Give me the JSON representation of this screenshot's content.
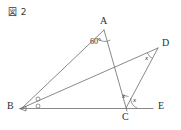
{
  "figure": {
    "caption": "図 2",
    "type": "euclidean-geometry-diagram",
    "stroke_color": "#6b6b6b",
    "label_color": "#2e2e2e",
    "background": "#ffffff",
    "vertices": [
      {
        "id": "A",
        "label": "A",
        "x": 104,
        "y": 30,
        "label_x": 100,
        "label_y": 17
      },
      {
        "id": "B",
        "label": "B",
        "x": 22,
        "y": 108,
        "label_x": 8,
        "label_y": 102
      },
      {
        "id": "C",
        "label": "C",
        "x": 126,
        "y": 108,
        "label_x": 122,
        "label_y": 112
      },
      {
        "id": "D",
        "label": "D",
        "x": 158,
        "y": 48,
        "label_x": 163,
        "label_y": 39
      },
      {
        "id": "E",
        "label": "E",
        "x": 152,
        "y": 108,
        "label_x": 158,
        "label_y": 101
      }
    ],
    "segments": [
      {
        "name": "segment-BA",
        "from": "B",
        "to": "A"
      },
      {
        "name": "segment-AC",
        "from": "A",
        "to": "C"
      },
      {
        "name": "segment-BD",
        "from": "B",
        "to": "D"
      },
      {
        "name": "segment-CD",
        "from": "C",
        "to": "D"
      },
      {
        "name": "segment-BE",
        "from": "B",
        "to": "E"
      }
    ],
    "angle_labels": [
      {
        "name": "angle-A-60",
        "text": "60°",
        "x": 91,
        "y": 38,
        "style": "plain"
      },
      {
        "name": "angle-D-x",
        "text": "x",
        "x": 146,
        "y": 56,
        "style": "var"
      },
      {
        "name": "angle-BCA-x",
        "text": "x",
        "x": 122,
        "y": 95,
        "style": "var"
      },
      {
        "name": "angle-DCE-x",
        "text": "x",
        "x": 133,
        "y": 98,
        "style": "var"
      }
    ],
    "equal_angle_marks": [
      {
        "name": "angle-mark-ABD",
        "cx": 38,
        "cy": 99,
        "r": 2
      },
      {
        "name": "angle-mark-DBE",
        "cx": 38,
        "cy": 106,
        "r": 2
      }
    ]
  }
}
